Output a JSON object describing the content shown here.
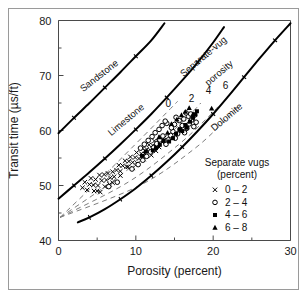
{
  "figure": {
    "background": "#ffffff",
    "border_color": "#9a9a9a"
  },
  "chart_data": {
    "type": "scatter",
    "title": "",
    "xlabel": "Porosity (percent)",
    "ylabel": "Transit time (µs/ft)",
    "xlim": [
      0,
      30
    ],
    "ylim": [
      40,
      80
    ],
    "xticks": [
      0,
      10,
      20,
      30
    ],
    "xticks_minor": [
      5,
      15,
      25
    ],
    "yticks": [
      40,
      50,
      60,
      70,
      80
    ],
    "yticks_minor": [
      45,
      55,
      65,
      75
    ],
    "grid": false,
    "legend_position": "lower-right-inside",
    "legend_title_line1": "Separate vugs",
    "legend_title_line2": "(percent)",
    "legend": [
      {
        "marker": "x",
        "label": "0 – 2"
      },
      {
        "marker": "circle",
        "label": "2 – 4"
      },
      {
        "marker": "square",
        "label": "4 – 6"
      },
      {
        "marker": "triangle",
        "label": "6 – 8"
      }
    ],
    "annotations": [
      {
        "text": "Sandstone",
        "x": 5.5,
        "y": 69.5,
        "rotation": -38
      },
      {
        "text": "Limestone",
        "x": 9.0,
        "y": 61.5,
        "rotation": -40
      },
      {
        "text": "Dolomite",
        "x": 22.0,
        "y": 62.0,
        "rotation": -40
      },
      {
        "text": "Separate-vug",
        "x": 19.0,
        "y": 73.0,
        "rotation": -40
      },
      {
        "text": "porosity",
        "x": 21.0,
        "y": 70.0,
        "rotation": -40
      }
    ],
    "vug_line_labels": [
      {
        "text": "0",
        "x": 14.2,
        "y": 64.3
      },
      {
        "text": "2",
        "x": 17.2,
        "y": 65.2
      },
      {
        "text": "4",
        "x": 19.4,
        "y": 66.6
      },
      {
        "text": "6",
        "x": 21.6,
        "y": 67.6
      }
    ],
    "reference_curves": [
      {
        "name": "Sandstone",
        "style": "solid",
        "points": [
          [
            0,
            59.5
          ],
          [
            2,
            62.3
          ],
          [
            4,
            65.0
          ],
          [
            6,
            67.8
          ],
          [
            8,
            70.6
          ],
          [
            10,
            73.5
          ],
          [
            12,
            76.4
          ],
          [
            13.7,
            79.5
          ]
        ]
      },
      {
        "name": "Limestone",
        "style": "solid",
        "points": [
          [
            0,
            47.6
          ],
          [
            2,
            50.0
          ],
          [
            4,
            52.4
          ],
          [
            6,
            54.9
          ],
          [
            8,
            57.5
          ],
          [
            10,
            60.2
          ],
          [
            12,
            63.0
          ],
          [
            14,
            66.0
          ],
          [
            16,
            69.1
          ],
          [
            18,
            72.4
          ],
          [
            20,
            76.0
          ],
          [
            21.4,
            78.8
          ]
        ]
      },
      {
        "name": "Dolomite",
        "style": "solid",
        "points": [
          [
            2.5,
            43.3
          ],
          [
            4,
            44.2
          ],
          [
            6,
            45.7
          ],
          [
            8,
            47.5
          ],
          [
            10,
            49.5
          ],
          [
            12,
            51.8
          ],
          [
            14,
            54.3
          ],
          [
            16,
            57.0
          ],
          [
            18,
            59.9
          ],
          [
            20,
            63.0
          ],
          [
            22,
            66.3
          ],
          [
            24,
            69.7
          ],
          [
            26,
            73.1
          ],
          [
            28,
            76.4
          ],
          [
            30,
            79.5
          ]
        ]
      }
    ],
    "vug_lines": [
      {
        "label": "0",
        "points": [
          [
            0.2,
            44.2
          ],
          [
            6,
            52.0
          ],
          [
            11,
            59.0
          ],
          [
            14.5,
            64.0
          ],
          [
            15.4,
            65.3
          ]
        ]
      },
      {
        "label": "2",
        "points": [
          [
            0.2,
            44.2
          ],
          [
            7.5,
            51.3
          ],
          [
            13.5,
            58.3
          ],
          [
            17.2,
            63.2
          ],
          [
            18.4,
            65.0
          ]
        ]
      },
      {
        "label": "4",
        "points": [
          [
            0.2,
            44.2
          ],
          [
            9.0,
            50.6
          ],
          [
            15.5,
            57.4
          ],
          [
            19.6,
            62.8
          ],
          [
            20.9,
            64.8
          ]
        ]
      },
      {
        "label": "6",
        "points": [
          [
            0.2,
            44.2
          ],
          [
            10.5,
            50.0
          ],
          [
            17.5,
            56.6
          ],
          [
            21.8,
            62.2
          ],
          [
            23.2,
            64.4
          ]
        ]
      }
    ],
    "series": [
      {
        "name": "0 – 2",
        "marker": "x",
        "points": [
          [
            3.1,
            49.6
          ],
          [
            3.4,
            50.6
          ],
          [
            3.7,
            49.2
          ],
          [
            4.0,
            50.2
          ],
          [
            4.2,
            51.3
          ],
          [
            4.5,
            50.1
          ],
          [
            4.8,
            51.1
          ],
          [
            5.1,
            50.0
          ],
          [
            5.3,
            51.9
          ],
          [
            5.6,
            50.9
          ],
          [
            5.9,
            52.0
          ],
          [
            6.2,
            51.0
          ],
          [
            6.4,
            52.2
          ],
          [
            6.7,
            51.4
          ],
          [
            7.0,
            52.5
          ],
          [
            7.2,
            51.6
          ],
          [
            7.5,
            52.8
          ],
          [
            7.8,
            53.7
          ],
          [
            8.0,
            52.6
          ],
          [
            8.3,
            53.6
          ],
          [
            8.6,
            54.5
          ],
          [
            8.8,
            53.4
          ],
          [
            9.1,
            54.4
          ],
          [
            9.3,
            55.2
          ],
          [
            9.6,
            54.2
          ],
          [
            9.9,
            55.1
          ],
          [
            10.1,
            56.0
          ],
          [
            10.4,
            54.9
          ],
          [
            10.7,
            55.8
          ],
          [
            10.9,
            56.7
          ],
          [
            11.2,
            55.7
          ],
          [
            11.4,
            56.6
          ],
          [
            11.7,
            57.4
          ],
          [
            11.9,
            56.4
          ],
          [
            12.2,
            57.3
          ],
          [
            12.4,
            58.1
          ],
          [
            12.7,
            57.1
          ],
          [
            12.9,
            58.0
          ],
          [
            13.2,
            58.8
          ],
          [
            13.4,
            57.9
          ],
          [
            13.7,
            58.7
          ],
          [
            5.0,
            49.0
          ],
          [
            5.4,
            48.8
          ],
          [
            6.0,
            49.8
          ],
          [
            6.6,
            50.2
          ],
          [
            4.6,
            49.0
          ],
          [
            9.0,
            53.4
          ],
          [
            9.6,
            53.2
          ],
          [
            10.2,
            54.0
          ],
          [
            11.0,
            54.8
          ],
          [
            12.0,
            55.5
          ],
          [
            12.6,
            56.3
          ],
          [
            13.0,
            57.0
          ],
          [
            8.0,
            51.8
          ],
          [
            7.0,
            50.5
          ]
        ]
      },
      {
        "name": "2 – 4",
        "marker": "circle",
        "points": [
          [
            6.5,
            49.8
          ],
          [
            7.6,
            50.6
          ],
          [
            9.5,
            53.0
          ],
          [
            10.3,
            53.8
          ],
          [
            10.9,
            54.6
          ],
          [
            11.4,
            55.3
          ],
          [
            11.9,
            56.1
          ],
          [
            12.3,
            56.9
          ],
          [
            12.7,
            57.6
          ],
          [
            13.1,
            58.3
          ],
          [
            13.5,
            59.0
          ],
          [
            13.9,
            57.5
          ],
          [
            14.2,
            58.3
          ],
          [
            14.5,
            59.1
          ],
          [
            14.8,
            59.8
          ],
          [
            15.1,
            58.6
          ],
          [
            15.4,
            59.4
          ],
          [
            15.7,
            60.2
          ],
          [
            16.0,
            60.9
          ],
          [
            16.3,
            59.6
          ],
          [
            16.6,
            60.4
          ],
          [
            16.9,
            61.2
          ],
          [
            17.2,
            61.9
          ],
          [
            17.5,
            60.7
          ],
          [
            17.8,
            61.5
          ],
          [
            12.1,
            58.9
          ],
          [
            12.5,
            59.6
          ],
          [
            13.0,
            60.2
          ],
          [
            13.4,
            60.9
          ],
          [
            14.0,
            61.3
          ],
          [
            14.6,
            60.5
          ],
          [
            15.0,
            61.1
          ],
          [
            15.6,
            61.8
          ],
          [
            16.2,
            62.1
          ],
          [
            16.8,
            62.6
          ],
          [
            17.1,
            63.0
          ],
          [
            17.6,
            62.8
          ],
          [
            11.6,
            58.2
          ],
          [
            11.1,
            57.5
          ],
          [
            10.6,
            56.8
          ],
          [
            13.8,
            61.7
          ],
          [
            15.2,
            62.4
          ],
          [
            16.5,
            63.2
          ]
        ]
      },
      {
        "name": "4 – 6",
        "marker": "square",
        "points": [
          [
            10.8,
            55.4
          ],
          [
            11.3,
            56.2
          ],
          [
            12.6,
            56.8
          ],
          [
            13.1,
            57.4
          ],
          [
            13.6,
            58.1
          ],
          [
            14.8,
            58.6
          ],
          [
            15.2,
            59.4
          ],
          [
            16.0,
            59.9
          ],
          [
            16.6,
            60.5
          ],
          [
            17.0,
            61.6
          ],
          [
            17.4,
            62.3
          ],
          [
            17.7,
            62.9
          ],
          [
            17.9,
            63.5
          ],
          [
            16.4,
            61.0
          ],
          [
            15.7,
            60.2
          ],
          [
            12.2,
            56.4
          ],
          [
            14.3,
            58.0
          ]
        ]
      },
      {
        "name": "6 – 8",
        "marker": "triangle",
        "points": [
          [
            13.0,
            58.8
          ],
          [
            14.1,
            59.6
          ],
          [
            14.6,
            61.2
          ],
          [
            15.3,
            62.0
          ],
          [
            15.9,
            62.8
          ],
          [
            16.4,
            63.4
          ],
          [
            16.9,
            64.1
          ],
          [
            19.8,
            64.0
          ],
          [
            17.4,
            63.0
          ]
        ]
      }
    ]
  }
}
